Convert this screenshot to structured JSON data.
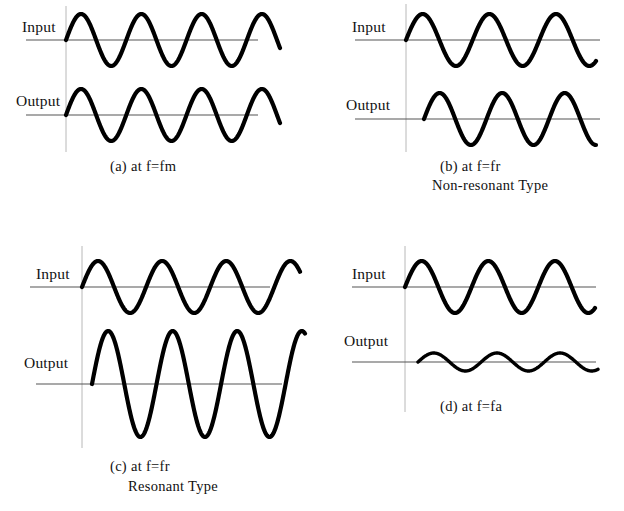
{
  "figure": {
    "background_color": "#ffffff",
    "trace_color": "#000000",
    "axis_color": "#555555",
    "vertical_axis_color": "#b8b8b8",
    "panel_count": 4
  },
  "labels": {
    "input": "Input",
    "output": "Output"
  },
  "panels": [
    {
      "id": "a",
      "caption_line1": "(a)  at  f=fm",
      "caption_line2": "",
      "input_label": "Input",
      "output_label": "Output"
    },
    {
      "id": "b",
      "caption_line1": "(b)  at  f=fr",
      "caption_line2": "Non-resonant  Type",
      "input_label": "Input",
      "output_label": "Output"
    },
    {
      "id": "c",
      "caption_line1": "(c)  at  f=fr",
      "caption_line2": "Resonant  Type",
      "input_label": "Input",
      "output_label": "Output"
    },
    {
      "id": "d",
      "caption_line1": "(d)  at  f=fa",
      "caption_line2": "",
      "input_label": "Input",
      "output_label": "Output"
    }
  ],
  "chart_data": {
    "type": "line",
    "xlabel": "",
    "ylabel": "",
    "grid": false,
    "legend_position": "none",
    "waveforms": [
      {
        "panel": "a",
        "name": "Input at f=fm",
        "shape": "sine",
        "amplitude": 26,
        "cycles": 3.55,
        "phase_deg": 0,
        "start_x": 66,
        "end_x": 280,
        "baseline_y": 40,
        "axis_line_x1": 26,
        "axis_line_x2": 258
      },
      {
        "panel": "a",
        "name": "Output at f=fm",
        "shape": "sine",
        "amplitude": 26,
        "cycles": 3.55,
        "phase_deg": 0,
        "start_x": 66,
        "end_x": 280,
        "baseline_y": 115,
        "axis_line_x1": 26,
        "axis_line_x2": 258
      },
      {
        "panel": "b",
        "name": "Input at f=fr",
        "shape": "sine",
        "amplitude": 26,
        "cycles": 2.85,
        "phase_deg": 0,
        "start_x": 406,
        "end_x": 596,
        "baseline_y": 40,
        "axis_line_x1": 355,
        "axis_line_x2": 600
      },
      {
        "panel": "b",
        "name": "Output at f=fr (non-resonant)",
        "shape": "sine",
        "amplitude": 26,
        "cycles": 2.75,
        "phase_deg": 0,
        "start_x": 424,
        "end_x": 596,
        "baseline_y": 119,
        "axis_line_x1": 355,
        "axis_line_x2": 600
      },
      {
        "panel": "c",
        "name": "Input at f=fr (resonant)",
        "shape": "sine",
        "amplitude": 26,
        "cycles": 3.4,
        "phase_deg": 0,
        "start_x": 82,
        "end_x": 300,
        "baseline_y": 287,
        "axis_line_x1": 30,
        "axis_line_x2": 270
      },
      {
        "panel": "c",
        "name": "Output at f=fr (resonant)",
        "shape": "sine",
        "amplitude": 53,
        "cycles": 3.3,
        "phase_deg": 0,
        "start_x": 92,
        "end_x": 305,
        "baseline_y": 384,
        "axis_line_x1": 36,
        "axis_line_x2": 282
      },
      {
        "panel": "d",
        "name": "Input at f=fa",
        "shape": "sine",
        "amplitude": 26,
        "cycles": 2.85,
        "phase_deg": 0,
        "start_x": 405,
        "end_x": 595,
        "baseline_y": 287,
        "axis_line_x1": 352,
        "axis_line_x2": 596
      },
      {
        "panel": "d",
        "name": "Output at f=fa",
        "shape": "sine",
        "amplitude": 9,
        "cycles": 2.85,
        "phase_deg": 0,
        "start_x": 418,
        "end_x": 598,
        "baseline_y": 362,
        "axis_line_x1": 352,
        "axis_line_x2": 596
      }
    ]
  }
}
